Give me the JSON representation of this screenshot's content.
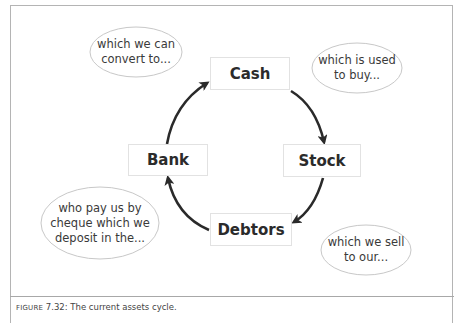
{
  "diagram": {
    "title": "Current assets cycle",
    "nodes": [
      {
        "id": "cash",
        "label": "Cash"
      },
      {
        "id": "stock",
        "label": "Stock"
      },
      {
        "id": "debtors",
        "label": "Debtors"
      },
      {
        "id": "bank",
        "label": "Bank"
      }
    ],
    "edges": [
      {
        "from": "bank",
        "to": "cash"
      },
      {
        "from": "cash",
        "to": "stock"
      },
      {
        "from": "stock",
        "to": "debtors"
      },
      {
        "from": "debtors",
        "to": "bank"
      }
    ],
    "annotations": [
      {
        "id": "bank-to-cash",
        "lines": [
          "which we can",
          "convert to..."
        ]
      },
      {
        "id": "cash-to-stock",
        "lines": [
          "which is used",
          "to buy..."
        ]
      },
      {
        "id": "debtors-to-bank",
        "lines": [
          "who pay us by",
          "cheque which we",
          "deposit in the..."
        ]
      },
      {
        "id": "stock-to-debtors",
        "lines": [
          "which we sell",
          "to our..."
        ]
      }
    ],
    "colors": {
      "arrow": "#2a2a2a",
      "node_border": "#e2e2e2",
      "bubble_border": "#c8c8c8",
      "text": "#2b2b2b"
    }
  },
  "caption": {
    "label_prefix": "Figure",
    "label_number": " 7.32:",
    "text": " The current assets cycle."
  }
}
